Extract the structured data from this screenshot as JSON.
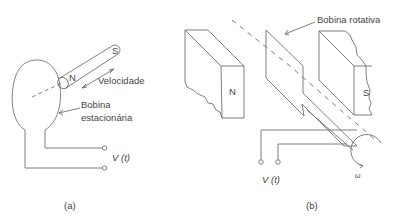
{
  "figure_a": {
    "caption": "(a)",
    "magnet_north": "N",
    "magnet_south": "S",
    "velocity_label": "Velocidade",
    "coil_label_line1": "Bobina",
    "coil_label_line2": "estacionária",
    "voltage_label_v": "V",
    "voltage_label_t": "(t)"
  },
  "figure_b": {
    "caption": "(b)",
    "pole_north": "N",
    "pole_south": "S",
    "coil_label": "Bobina rotativa",
    "voltage_label_v": "V",
    "voltage_label_t": "(t)",
    "omega_label": "ω"
  },
  "colors": {
    "line": "#666666",
    "text": "#444444",
    "background": "#ffffff"
  }
}
